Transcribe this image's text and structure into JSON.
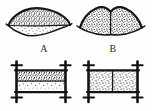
{
  "figure": {
    "caption": "",
    "background_color": "#fefefe",
    "ink_color": "#1a1a1a",
    "stipple_color": "#2a2a2a",
    "width": 152,
    "height": 111
  },
  "labels": {
    "a": "A",
    "b": "B"
  },
  "specimens": [
    {
      "id": "A",
      "label": "A",
      "top_view": {
        "shape": "lenticular-cross-section",
        "outline": "biconvex lens with upturned pointed tips",
        "divisions": 2,
        "division_axis": "horizontal",
        "layers": [
          {
            "name": "upper-layer",
            "texture": "dense-stipple",
            "fill_density": "high"
          },
          {
            "name": "lower-layer",
            "texture": "sparse-stipple",
            "fill_density": "low"
          }
        ]
      },
      "bottom_view": {
        "shape": "rectangular-frame",
        "post_count": 2,
        "post_orientation": "vertical",
        "crossbar_count": 4,
        "divisions": 2,
        "division_axis": "horizontal",
        "layers": [
          {
            "name": "upper-layer",
            "texture": "dense-stipple",
            "fill_density": "high"
          },
          {
            "name": "lower-layer",
            "texture": "sparse-stipple",
            "fill_density": "low"
          }
        ]
      }
    },
    {
      "id": "B",
      "label": "B",
      "top_view": {
        "shape": "lenticular-cross-section",
        "outline": "bilobed dome with central notch and upturned tips",
        "divisions": 2,
        "division_axis": "vertical",
        "layers": [
          {
            "name": "left-half",
            "texture": "dense-stipple",
            "fill_density": "high"
          },
          {
            "name": "right-half",
            "texture": "dense-stipple",
            "fill_density": "high"
          }
        ]
      },
      "bottom_view": {
        "shape": "rectangular-frame",
        "post_count": 2,
        "post_orientation": "vertical",
        "crossbar_count": 4,
        "divisions": 2,
        "division_axis": "vertical",
        "layers": [
          {
            "name": "left-half",
            "texture": "medium-stipple",
            "fill_density": "medium"
          },
          {
            "name": "right-half",
            "texture": "medium-stipple",
            "fill_density": "medium"
          }
        ]
      }
    }
  ]
}
